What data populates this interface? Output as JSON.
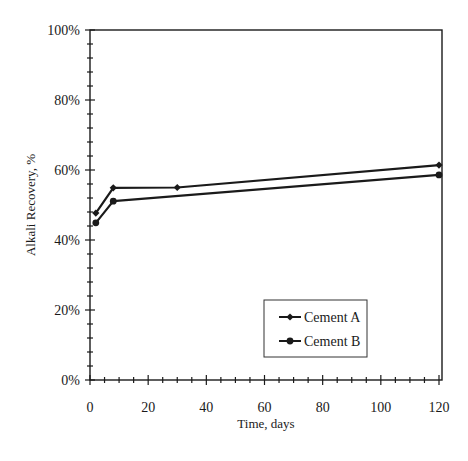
{
  "chart_data": {
    "type": "line",
    "title": "",
    "xlabel": "Time, days",
    "ylabel": "Alkali Recovery, %",
    "xlim": [
      0,
      120
    ],
    "ylim": [
      0,
      100
    ],
    "x_ticks": [
      0,
      20,
      40,
      60,
      80,
      100,
      120
    ],
    "x_tick_labels": [
      "0",
      "20",
      "40",
      "60",
      "80",
      "100",
      "120"
    ],
    "y_ticks": [
      0,
      20,
      40,
      60,
      80,
      100
    ],
    "y_tick_labels": [
      "0%",
      "20%",
      "40%",
      "60%",
      "80%",
      "100%"
    ],
    "x_minor_step": 5,
    "y_minor_step": 4,
    "grid": false,
    "legend_position": "lower right (inside)",
    "series": [
      {
        "name": "Cement A",
        "marker": "diamond",
        "x": [
          2,
          8,
          30,
          120
        ],
        "y": [
          47.7,
          54.9,
          55.0,
          61.4
        ]
      },
      {
        "name": "Cement B",
        "marker": "circle",
        "x": [
          2,
          8,
          120
        ],
        "y": [
          44.9,
          51.1,
          58.6
        ]
      }
    ]
  },
  "colors": {
    "line": "#1a1a1a",
    "background": "#ffffff"
  }
}
